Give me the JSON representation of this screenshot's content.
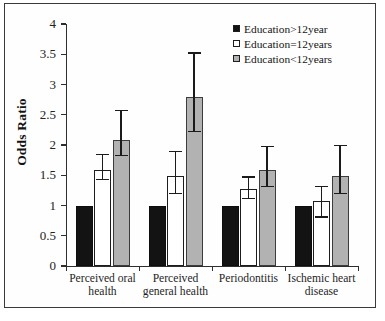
{
  "chart_data": {
    "type": "bar",
    "title": "",
    "xlabel": "",
    "ylabel": "Odds Ratio",
    "ylim": [
      0,
      4
    ],
    "ytick_labels": [
      "0",
      "0.5",
      "1",
      "1.5",
      "2",
      "2.5",
      "3",
      "3.5",
      "4"
    ],
    "ytick_values": [
      0,
      0.5,
      1,
      1.5,
      2,
      2.5,
      3,
      3.5,
      4
    ],
    "grid": false,
    "legend_position": "top-right",
    "categories": [
      "Perceived oral health",
      "Perceived general health",
      "Periodontitis",
      "Ischemic heart disease"
    ],
    "category_lines": [
      [
        "Perceived oral",
        "health"
      ],
      [
        "Perceived",
        "general health"
      ],
      [
        "Periodontitis",
        ""
      ],
      [
        "Ischemic heart",
        "disease"
      ]
    ],
    "series": [
      {
        "name": "Education>12year",
        "color": "#131313",
        "style": "filled-black",
        "values": [
          1.0,
          1.0,
          1.0,
          1.0
        ],
        "error_low": [
          null,
          null,
          null,
          null
        ],
        "error_high": [
          null,
          null,
          null,
          null
        ]
      },
      {
        "name": "Education=12years",
        "color": "#ffffff",
        "style": "open-white",
        "values": [
          1.58,
          1.49,
          1.28,
          1.08
        ],
        "error_low": [
          1.42,
          1.19,
          1.1,
          0.8
        ],
        "error_high": [
          1.85,
          1.9,
          1.48,
          1.32
        ]
      },
      {
        "name": "Education<12years",
        "color": "#b2b2b2",
        "style": "filled-grey",
        "values": [
          2.08,
          2.79,
          1.58,
          1.49
        ],
        "error_low": [
          1.81,
          2.21,
          1.3,
          1.19
        ],
        "error_high": [
          2.58,
          3.53,
          1.99,
          2.0
        ]
      }
    ]
  },
  "legend": {
    "items": [
      {
        "label": "Education>12year",
        "swatch": "black"
      },
      {
        "label": "Education=12years",
        "swatch": "white"
      },
      {
        "label": "Education<12years",
        "swatch": "grey"
      }
    ]
  },
  "axis": {
    "y_title": "Odds Ratio"
  }
}
